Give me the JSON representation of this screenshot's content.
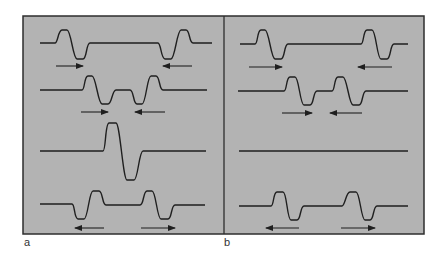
{
  "figure": {
    "background_color": "#b3b3b3",
    "border_color": "#2e2e2e",
    "line_color": "#1f1f1f",
    "frame": {
      "x": 23,
      "y": 16,
      "width": 401,
      "height": 218,
      "divider_x": 224
    }
  },
  "panels": [
    {
      "label": "a",
      "label_pos": {
        "x": 24,
        "y": 236
      },
      "rows": [
        {
          "name": "row-1",
          "path": "M40,43 L55,43 C58,43 58,30 62,30 L67,30 C71,30 73,59 77,59 L83,59 C87,59 86,43 90,43 L158,43 C161,43 161,59 165,59 L171,59 C175,59 177,30 181,30 L186,30 C190,30 189,43 193,43 L212,43",
          "arrows": [
            {
              "x1": 56,
              "x2": 83,
              "y": 66,
              "direction": "right"
            },
            {
              "x1": 163,
              "x2": 192,
              "y": 66,
              "direction": "left"
            }
          ]
        },
        {
          "name": "row-2",
          "path": "M40,90 L82,90 C85,90 84,76 88,76 L92,76 C96,76 98,104 102,104 L108,104 C112,104 112,90 116,90 L130,90 C134,90 133,104 137,104 L142,104 C146,104 147,76 151,76 L156,76 C160,76 159,90 163,90 L207,90",
          "arrows": [
            {
              "x1": 81,
              "x2": 108,
              "y": 112,
              "direction": "right"
            },
            {
              "x1": 135,
              "x2": 165,
              "y": 112,
              "direction": "left"
            }
          ]
        },
        {
          "name": "row-3",
          "path": "M40,151 L103,151 C106,151 105,123 109,123 L116,123 C120,123 123,180 127,180 L134,180 C138,180 139,151 143,151 L206,151",
          "arrows": []
        },
        {
          "name": "row-4",
          "path": "M40,204 L72,204 C75,204 74,219 78,219 L84,219 C88,219 89,191 93,191 L99,191 C103,191 102,205 106,205 L140,205 C144,205 143,191 147,191 L152,191 C156,191 157,219 161,219 L168,219 C172,219 171,205 175,205 L205,205",
          "arrows": [
            {
              "x1": 75,
              "x2": 104,
              "y": 228,
              "direction": "left"
            },
            {
              "x1": 141,
              "x2": 175,
              "y": 228,
              "direction": "right"
            }
          ]
        }
      ]
    },
    {
      "label": "b",
      "label_pos": {
        "x": 224,
        "y": 236
      },
      "rows": [
        {
          "name": "row-1",
          "path": "M240,44 L255,44 C258,44 257,30 261,30 L265,30 C269,30 271,59 275,59 L281,59 C285,59 284,44 288,44 L361,44 C364,44 363,30 367,30 L372,30 C376,30 377,59 381,59 L387,59 C391,59 390,44 394,44 L408,44",
          "arrows": [
            {
              "x1": 249,
              "x2": 282,
              "y": 67,
              "direction": "right"
            },
            {
              "x1": 358,
              "x2": 392,
              "y": 67,
              "direction": "left"
            }
          ]
        },
        {
          "name": "row-2",
          "path": "M238,91 L284,91 C287,91 286,77 290,77 L295,77 C299,77 300,105 304,105 L310,105 C314,105 313,91 317,91 L332,91 C335,91 334,77 338,77 L343,77 C347,77 349,105 353,105 L359,105 C363,105 362,91 366,91 L408,91",
          "arrows": [
            {
              "x1": 282,
              "x2": 312,
              "y": 113,
              "direction": "right"
            },
            {
              "x1": 330,
              "x2": 362,
              "y": 113,
              "direction": "left"
            }
          ]
        },
        {
          "name": "row-3",
          "path": "M239,151 L408,151",
          "arrows": []
        },
        {
          "name": "row-4",
          "path": "M239,206 L271,206 C274,206 273,192 277,192 L283,192 C287,192 287,220 291,220 L297,220 C301,220 300,206 304,206 L342,206 C345,206 346,192 350,192 L356,192 C360,192 361,220 365,220 L370,220 C374,220 373,206 377,206 L408,206",
          "arrows": [
            {
              "x1": 266,
              "x2": 299,
              "y": 228,
              "direction": "left"
            },
            {
              "x1": 341,
              "x2": 375,
              "y": 228,
              "direction": "right"
            }
          ]
        }
      ]
    }
  ]
}
